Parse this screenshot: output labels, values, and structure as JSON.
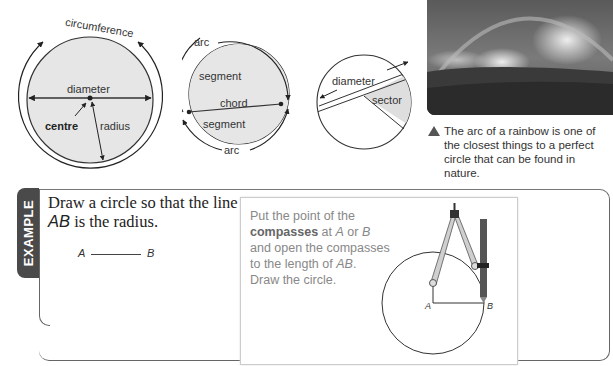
{
  "diagram1": {
    "circumference_label": "circumference",
    "diameter_label": "diameter",
    "centre_label": "centre",
    "radius_label": "radius"
  },
  "diagram2": {
    "arc_top_label": "arc",
    "segment_top_label": "segment",
    "chord_label": "chord",
    "segment_bottom_label": "segment",
    "arc_bottom_label": "arc"
  },
  "diagram3": {
    "diameter_label": "diameter",
    "sector_label": "sector"
  },
  "photo": {
    "alt": "rainbow over a field",
    "caption": "The arc of a rainbow is one of the closest things to a perfect circle that can be found in nature."
  },
  "example": {
    "tab_label": "EXAMPLE",
    "question_part1": "Draw a circle so that the line",
    "question_ab": "AB",
    "question_part2": " is the radius.",
    "point_a": "A",
    "point_b": "B",
    "instructions": {
      "line1": "Put the point of the",
      "bold_word": "compasses",
      "line2_rest": " at ",
      "a": "A",
      "or": " or ",
      "b": "B",
      "line3": "and open the compasses",
      "line4_start": "to the length of ",
      "ab": "AB",
      "line4_end": ".",
      "line5": "Draw the circle."
    },
    "diagram_a": "A",
    "diagram_b": "B"
  },
  "colors": {
    "fill_grey": "#e6e6e6",
    "tab_bg": "#4a4a4a",
    "instruction_text": "#888888"
  }
}
